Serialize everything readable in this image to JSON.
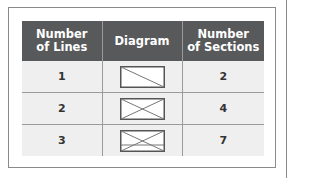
{
  "table": {
    "headers": {
      "lines": "Number\nof Lines",
      "diagram": "Diagram",
      "sections": "Number\nof Sections"
    },
    "header_lines": {
      "line1": "Number",
      "line2": "of Lines"
    },
    "header_sections": {
      "line1": "Number",
      "line2": "of Sections"
    },
    "rows": [
      {
        "lines": "1",
        "diagram": "rectangle-one-diagonal",
        "sections": "2"
      },
      {
        "lines": "2",
        "diagram": "rectangle-two-diagonals",
        "sections": "4"
      },
      {
        "lines": "3",
        "diagram": "rectangle-two-diagonals-one-horizontal",
        "sections": "7"
      }
    ]
  },
  "colors": {
    "header_bg": "#58595b",
    "row_bg": "#efefef",
    "border": "#9a9a9a"
  }
}
